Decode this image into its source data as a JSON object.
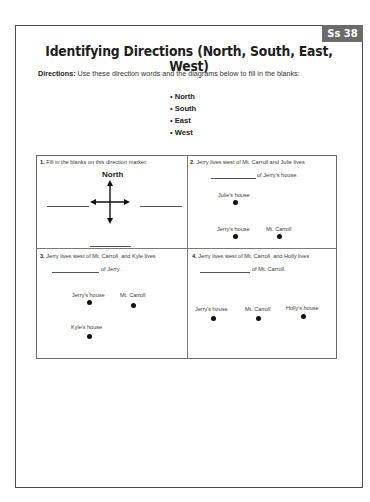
{
  "header": {
    "badge": "Ss 38",
    "title": "Identifying Directions (North, South, East, West)"
  },
  "directions": {
    "label": "Directions:",
    "text": "Use these direction words and the diagrams below to fill in the blanks:"
  },
  "word_bank": [
    "North",
    "South",
    "East",
    "West"
  ],
  "questions": [
    {
      "number": "1.",
      "text": "Fill in the blanks on this direction marker.",
      "compass_label": "North"
    },
    {
      "number": "2.",
      "text": "Jerry lives west of Mt. Carroll and Julie lives",
      "after_blank": "of Jerry's house.",
      "places": [
        "Julie's house",
        "Jerry's house",
        "Mt. Carroll"
      ]
    },
    {
      "number": "3.",
      "text": "Jerry lives west of Mt. Carroll, and Kyle lives",
      "after_blank": "of Jerry.",
      "places": [
        "Jerry's house",
        "Mt. Carroll",
        "Kyle's house"
      ]
    },
    {
      "number": "4.",
      "text": "Jerry lives west of Mt. Carroll, and Holly lives",
      "after_blank": "of Mt. Carroll.",
      "places": [
        "Jerry's house",
        "Mt. Carroll",
        "Holly's house"
      ]
    }
  ]
}
